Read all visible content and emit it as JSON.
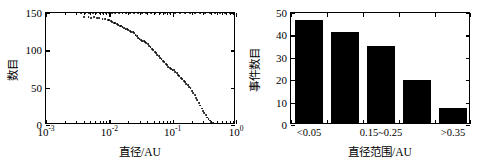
{
  "figure": {
    "background": "#ffffff",
    "foreground": "#000000",
    "panels": [
      "left",
      "right"
    ]
  },
  "left_panel": {
    "x_axis_title": "直径/AU",
    "y_axis_title": "数目",
    "x_tick_labels": [
      "10",
      "10",
      "10",
      "10"
    ],
    "x_tick_exponents": [
      "-3",
      "-2",
      "-1",
      "0"
    ],
    "y_tick_labels": [
      "0",
      "50",
      "100",
      "150"
    ]
  },
  "right_panel": {
    "x_axis_title": "直径范围/AU",
    "y_axis_title": "事件数目",
    "y_tick_labels": [
      "0",
      "10",
      "20",
      "30",
      "40",
      "50"
    ],
    "category_labels": [
      "<0.05",
      "0.15~0.25",
      ">0.35"
    ]
  },
  "chart_data": [
    {
      "type": "scatter",
      "panel": "left",
      "title": "",
      "xlabel": "直径/AU",
      "ylabel": "数目",
      "xscale": "log",
      "xlim": [
        0.001,
        1.0
      ],
      "ylim": [
        0,
        150
      ],
      "xticks": [
        0.001,
        0.01,
        0.1,
        1.0
      ],
      "xticklabels": [
        "10^-3",
        "10^-2",
        "10^-1",
        "10^0"
      ],
      "yticks": [
        0,
        50,
        100,
        150
      ],
      "grid": false,
      "legend": null,
      "marker": "point",
      "color": "#000000",
      "description": "Cumulative count of events versus diameter; curve stays near 150 for small diameters then falls monotonically to 0 near 0.4 AU.",
      "points": [
        {
          "x": 0.0036,
          "y": 150
        },
        {
          "x": 0.0042,
          "y": 150
        },
        {
          "x": 0.0048,
          "y": 150
        },
        {
          "x": 0.0055,
          "y": 150
        },
        {
          "x": 0.0062,
          "y": 150
        },
        {
          "x": 0.007,
          "y": 150
        },
        {
          "x": 0.0079,
          "y": 150
        },
        {
          "x": 0.0088,
          "y": 150
        },
        {
          "x": 0.0098,
          "y": 150
        },
        {
          "x": 0.011,
          "y": 150
        },
        {
          "x": 0.0125,
          "y": 150
        },
        {
          "x": 0.0142,
          "y": 150
        },
        {
          "x": 0.0162,
          "y": 150
        },
        {
          "x": 0.0185,
          "y": 150
        },
        {
          "x": 0.0212,
          "y": 150
        },
        {
          "x": 0.0245,
          "y": 150
        },
        {
          "x": 0.0285,
          "y": 150
        },
        {
          "x": 0.033,
          "y": 150
        },
        {
          "x": 0.0385,
          "y": 150
        },
        {
          "x": 0.045,
          "y": 150
        },
        {
          "x": 0.053,
          "y": 150
        },
        {
          "x": 0.063,
          "y": 150
        },
        {
          "x": 0.075,
          "y": 150
        },
        {
          "x": 0.09,
          "y": 150
        },
        {
          "x": 0.108,
          "y": 150
        },
        {
          "x": 0.13,
          "y": 150
        },
        {
          "x": 0.156,
          "y": 150
        },
        {
          "x": 0.188,
          "y": 150
        },
        {
          "x": 0.225,
          "y": 150
        },
        {
          "x": 0.27,
          "y": 150
        },
        {
          "x": 0.325,
          "y": 150
        },
        {
          "x": 0.39,
          "y": 150
        },
        {
          "x": 0.47,
          "y": 150
        },
        {
          "x": 0.56,
          "y": 150
        },
        {
          "x": 0.67,
          "y": 150
        },
        {
          "x": 0.8,
          "y": 150
        },
        {
          "x": 0.9,
          "y": 150
        },
        {
          "x": 0.96,
          "y": 150
        },
        {
          "x": 0.004,
          "y": 144
        },
        {
          "x": 0.0047,
          "y": 144
        },
        {
          "x": 0.0052,
          "y": 143
        },
        {
          "x": 0.0058,
          "y": 144
        },
        {
          "x": 0.0063,
          "y": 143
        },
        {
          "x": 0.0069,
          "y": 143
        },
        {
          "x": 0.0078,
          "y": 142
        },
        {
          "x": 0.0086,
          "y": 142
        },
        {
          "x": 0.0094,
          "y": 141
        },
        {
          "x": 0.01,
          "y": 141
        },
        {
          "x": 0.0106,
          "y": 139
        },
        {
          "x": 0.0112,
          "y": 138
        },
        {
          "x": 0.0118,
          "y": 137
        },
        {
          "x": 0.0124,
          "y": 136
        },
        {
          "x": 0.0131,
          "y": 135
        },
        {
          "x": 0.0138,
          "y": 134
        },
        {
          "x": 0.0146,
          "y": 133
        },
        {
          "x": 0.0154,
          "y": 132
        },
        {
          "x": 0.0162,
          "y": 131
        },
        {
          "x": 0.0171,
          "y": 130
        },
        {
          "x": 0.018,
          "y": 129
        },
        {
          "x": 0.019,
          "y": 128
        },
        {
          "x": 0.02,
          "y": 127
        },
        {
          "x": 0.0211,
          "y": 126
        },
        {
          "x": 0.0222,
          "y": 125
        },
        {
          "x": 0.0234,
          "y": 124
        },
        {
          "x": 0.0246,
          "y": 123
        },
        {
          "x": 0.0259,
          "y": 121
        },
        {
          "x": 0.0272,
          "y": 119
        },
        {
          "x": 0.0286,
          "y": 117
        },
        {
          "x": 0.03,
          "y": 115
        },
        {
          "x": 0.0315,
          "y": 114
        },
        {
          "x": 0.0331,
          "y": 113
        },
        {
          "x": 0.0348,
          "y": 112
        },
        {
          "x": 0.0366,
          "y": 111
        },
        {
          "x": 0.0385,
          "y": 110
        },
        {
          "x": 0.0405,
          "y": 108
        },
        {
          "x": 0.0426,
          "y": 106
        },
        {
          "x": 0.0448,
          "y": 104
        },
        {
          "x": 0.0471,
          "y": 102
        },
        {
          "x": 0.0495,
          "y": 100
        },
        {
          "x": 0.052,
          "y": 98
        },
        {
          "x": 0.0547,
          "y": 96
        },
        {
          "x": 0.0575,
          "y": 94
        },
        {
          "x": 0.0604,
          "y": 92
        },
        {
          "x": 0.0635,
          "y": 90
        },
        {
          "x": 0.0667,
          "y": 88
        },
        {
          "x": 0.0701,
          "y": 86
        },
        {
          "x": 0.0737,
          "y": 84
        },
        {
          "x": 0.0775,
          "y": 82
        },
        {
          "x": 0.0815,
          "y": 80
        },
        {
          "x": 0.0857,
          "y": 78
        },
        {
          "x": 0.0901,
          "y": 76
        },
        {
          "x": 0.0947,
          "y": 75
        },
        {
          "x": 0.0996,
          "y": 74
        },
        {
          "x": 0.1047,
          "y": 73
        },
        {
          "x": 0.1101,
          "y": 71
        },
        {
          "x": 0.1158,
          "y": 69
        },
        {
          "x": 0.1218,
          "y": 67
        },
        {
          "x": 0.1281,
          "y": 65
        },
        {
          "x": 0.1347,
          "y": 63
        },
        {
          "x": 0.1417,
          "y": 61
        },
        {
          "x": 0.149,
          "y": 59
        },
        {
          "x": 0.1567,
          "y": 57
        },
        {
          "x": 0.1648,
          "y": 55
        },
        {
          "x": 0.1733,
          "y": 53
        },
        {
          "x": 0.1823,
          "y": 51
        },
        {
          "x": 0.1917,
          "y": 49
        },
        {
          "x": 0.2016,
          "y": 46
        },
        {
          "x": 0.212,
          "y": 43
        },
        {
          "x": 0.223,
          "y": 40
        },
        {
          "x": 0.2345,
          "y": 36
        },
        {
          "x": 0.2466,
          "y": 33
        },
        {
          "x": 0.2594,
          "y": 29
        },
        {
          "x": 0.2728,
          "y": 26
        },
        {
          "x": 0.2869,
          "y": 22
        },
        {
          "x": 0.3017,
          "y": 19
        },
        {
          "x": 0.3173,
          "y": 16
        },
        {
          "x": 0.3337,
          "y": 13
        },
        {
          "x": 0.3509,
          "y": 10
        },
        {
          "x": 0.369,
          "y": 8
        },
        {
          "x": 0.3881,
          "y": 6
        },
        {
          "x": 0.4081,
          "y": 4
        },
        {
          "x": 0.4292,
          "y": 3
        },
        {
          "x": 0.4513,
          "y": 2
        },
        {
          "x": 0.4746,
          "y": 2
        },
        {
          "x": 0.4991,
          "y": 1
        },
        {
          "x": 0.5249,
          "y": 1
        },
        {
          "x": 0.552,
          "y": 1
        },
        {
          "x": 0.5805,
          "y": 1
        },
        {
          "x": 0.6105,
          "y": 0
        },
        {
          "x": 0.642,
          "y": 0
        },
        {
          "x": 0.6751,
          "y": 0
        },
        {
          "x": 0.71,
          "y": 0
        },
        {
          "x": 0.7467,
          "y": 0
        },
        {
          "x": 0.7852,
          "y": 0
        },
        {
          "x": 0.8258,
          "y": 0
        },
        {
          "x": 0.8684,
          "y": 0
        },
        {
          "x": 0.9132,
          "y": 0
        },
        {
          "x": 0.9604,
          "y": 0
        }
      ]
    },
    {
      "type": "bar",
      "panel": "right",
      "title": "",
      "xlabel": "直径范围/AU",
      "ylabel": "事件数目",
      "categories": [
        "<0.05",
        "0.05~0.15",
        "0.15~0.25",
        "0.25~0.35",
        ">0.35"
      ],
      "labeled_categories": [
        "<0.05",
        "0.15~0.25",
        ">0.35"
      ],
      "values": [
        46,
        40.5,
        34.5,
        19,
        6.8
      ],
      "ylim": [
        0,
        50
      ],
      "yticks": [
        0,
        10,
        20,
        30,
        40,
        50
      ],
      "grid": false,
      "legend": null,
      "bar_color": "#000000"
    }
  ]
}
